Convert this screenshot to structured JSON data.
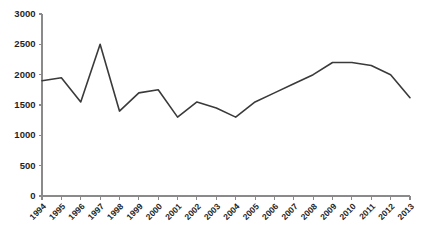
{
  "chart_data": {
    "type": "line",
    "title": "",
    "subtitle": "",
    "xlabel": "",
    "ylabel": "",
    "categories": [
      "1994",
      "1995",
      "1996",
      "1997",
      "1998",
      "1999",
      "2000",
      "2001",
      "2002",
      "2003",
      "2004",
      "2005",
      "2006",
      "2007",
      "2008",
      "2009",
      "2010",
      "2011",
      "2012",
      "2013"
    ],
    "series": [
      {
        "name": "series-1",
        "values": [
          1900,
          1950,
          1550,
          2500,
          1400,
          1700,
          1750,
          1300,
          1550,
          1450,
          1300,
          1550,
          1700,
          1850,
          2000,
          2200,
          2200,
          2150,
          2000,
          1620
        ]
      }
    ],
    "ylim": [
      0,
      3000
    ],
    "ytick_values": [
      0,
      500,
      1000,
      1500,
      2000,
      2500,
      3000
    ],
    "ytick_labels": [
      "0",
      "500",
      "1000",
      "1500",
      "2000",
      "2500",
      "3000"
    ],
    "xtick_labels": [
      "1994",
      "1995",
      "1996",
      "1997",
      "1998",
      "1999",
      "2000",
      "2001",
      "2002",
      "2003",
      "2004",
      "2005",
      "2006",
      "2007",
      "2008",
      "2009",
      "2010",
      "2011",
      "2012",
      "2013"
    ],
    "grid": false,
    "legend": false,
    "legend_position": "none",
    "colors": {
      "series_line": "#3a3a3a",
      "axis": "#8a8a8a",
      "tick_text": "#1f1f1f",
      "background": "#ffffff"
    },
    "xlabel_rotation": -45
  }
}
